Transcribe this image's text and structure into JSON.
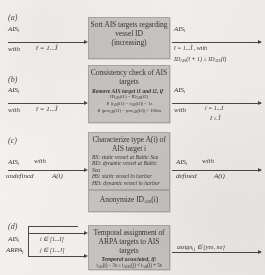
{
  "figure": {
    "type": "flowchart",
    "panels": [
      {
        "id": "a",
        "label": "(a)",
        "box": {
          "title_line1": "Sort AIS targets regarding",
          "title_line2": "vessel ID",
          "title_line3": "(increasing)"
        },
        "input": {
          "symbol": "AIS",
          "symbol_sub": "ĩ",
          "with": "with",
          "range": "ĩ = 1...Ĩ"
        },
        "output": {
          "symbol": "AIS",
          "symbol_sub": "ĩ",
          "range": "ĩ = 1...Ĩ , with",
          "condition": "ID",
          "condition_sub": "AIS",
          "condition_rest": "(ĩ + 1) ≥ ID",
          "condition_sub2": "AIS",
          "condition_rest2": "(ĩ)"
        }
      },
      {
        "id": "b",
        "label": "(b)",
        "box": {
          "title_line1": "Consistency check of AIS",
          "title_line2": "targets",
          "sub": "Remove AIS target i1 and i2, if",
          "eq1": "ID",
          "eq1_sub": "AIS",
          "eq1_rest": "(i1) = ID",
          "eq1_sub2": "AIS",
          "eq1_rest2": "(i2)",
          "eq2": "∧  |t",
          "eq2_sub": "AIS",
          "eq2_rest": "(i1) − t",
          "eq2_sub2": "AIS",
          "eq2_rest2": "(i2)| < 1s",
          "eq3": "∧  |pos",
          "eq3_sub": "AIS",
          "eq3_rest": "(i1) − pos",
          "eq3_sub2": "AIS",
          "eq3_rest2": "(i2)| < 100m"
        },
        "input": {
          "symbol": "AIS",
          "symbol_sub": "ĩ",
          "with": "with",
          "range": "ĩ = 1...Ĩ"
        },
        "output": {
          "symbol": "AIS",
          "symbol_sub": "i",
          "with": "with",
          "range": "i = 1...I",
          "condition": "I ≤ Ĩ"
        }
      },
      {
        "id": "c",
        "label": "(c)",
        "box": {
          "title_line1": "Characterize type A(i) of",
          "title_line2": "AIS target i",
          "types": [
            "BS: static vessel at Baltic Sea",
            "BD: dynamic vessel at Baltic Sea",
            "HS: static vessel in harbor",
            "HD: dynamic vessel in harbor"
          ]
        },
        "input": {
          "symbol": "AIS",
          "symbol_sub": "i",
          "with": "with",
          "state": "undefined",
          "value": "A(i)"
        },
        "output": {
          "symbol": "AIS",
          "symbol_sub": "i",
          "with": "with",
          "state": "defined",
          "value": "A(i)"
        }
      },
      {
        "id": "anon",
        "label": "",
        "box": {
          "title_line1": "Anonymize  ID",
          "title_sub": "AIS",
          "title_rest": "(i)"
        }
      },
      {
        "id": "d",
        "label": "(d)",
        "box": {
          "title_line1": "Temporal assignment of",
          "title_line2": "ARPA targets to AIS targets",
          "sub": "Temporal associated, if:",
          "eq1": "t",
          "eq1_sub": "AIS",
          "eq1_rest": "(i) − 5s ≤ t",
          "eq1_sub2": "ARPA",
          "eq1_rest2": "(j) < t",
          "eq1_sub3": "AIS",
          "eq1_rest3": "(i) + 5s"
        },
        "inputs": [
          {
            "symbol": "AIS",
            "symbol_sub": "i",
            "range": "i ∈ [1...I]"
          },
          {
            "symbol": "ARPA",
            "symbol_sub": "j",
            "range": "j ∈ [1...J]"
          }
        ],
        "output": {
          "symbol": "assign",
          "symbol_sub": "i,j",
          "rest": " ∈ {yes, no}"
        }
      }
    ]
  },
  "colors": {
    "box_fill": "#c9c7c4",
    "box_border": "#a9a7a4",
    "page_bg": "#f2f0ee",
    "ink": "#32302e",
    "arrow": "#45433f"
  }
}
